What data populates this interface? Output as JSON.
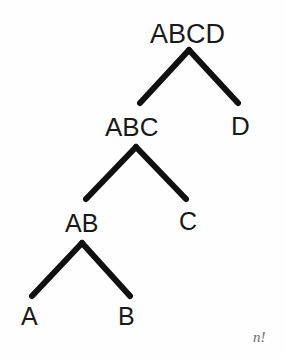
{
  "figure": {
    "type": "binary-tree-diagram",
    "background_color": "#fefefe",
    "stroke_color": "#101010",
    "text_color": "#1a1a1a",
    "edge_width_px": 6,
    "width": 285,
    "height": 358
  },
  "nodes": [
    {
      "id": "abcd",
      "label": "ABCD",
      "level": 0,
      "x": 192,
      "y": 35,
      "label_left": 150,
      "label_top": 21
    },
    {
      "id": "abc",
      "label": "ABC",
      "level": 1,
      "x": 136,
      "y": 128,
      "label_left": 105,
      "label_top": 114
    },
    {
      "id": "d",
      "label": "D",
      "level": 1,
      "x": 240,
      "y": 126,
      "label_left": 231,
      "label_top": 113
    },
    {
      "id": "ab",
      "label": "AB",
      "level": 2,
      "x": 84,
      "y": 224,
      "label_left": 65,
      "label_top": 211
    },
    {
      "id": "c",
      "label": "C",
      "level": 2,
      "x": 188,
      "y": 222,
      "label_left": 179,
      "label_top": 209
    },
    {
      "id": "a",
      "label": "A",
      "level": 3,
      "x": 31,
      "y": 318,
      "label_left": 21,
      "label_top": 304
    },
    {
      "id": "b",
      "label": "B",
      "level": 3,
      "x": 128,
      "y": 318,
      "label_left": 118,
      "label_top": 304
    }
  ],
  "edges": [
    {
      "from": "abcd",
      "to": "abc",
      "x1": 189,
      "y1": 50,
      "x2": 140,
      "y2": 103
    },
    {
      "from": "abcd",
      "to": "d",
      "x1": 189,
      "y1": 50,
      "x2": 238,
      "y2": 103
    },
    {
      "from": "abc",
      "to": "ab",
      "x1": 136,
      "y1": 147,
      "x2": 86,
      "y2": 199
    },
    {
      "from": "abc",
      "to": "c",
      "x1": 136,
      "y1": 147,
      "x2": 186,
      "y2": 199
    },
    {
      "from": "ab",
      "to": "a",
      "x1": 82,
      "y1": 243,
      "x2": 32,
      "y2": 296
    },
    {
      "from": "ab",
      "to": "b",
      "x1": 82,
      "y1": 243,
      "x2": 130,
      "y2": 296
    }
  ],
  "annotation": {
    "text": "n!",
    "left": 253,
    "top": 330
  }
}
